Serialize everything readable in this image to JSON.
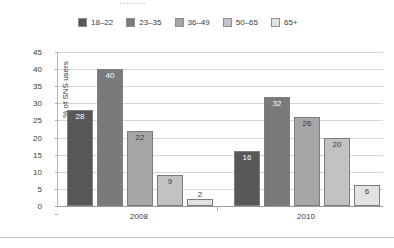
{
  "caption": {
    "text": "•  •   •      •                                                  •   •  •  •"
  },
  "chart_data": {
    "type": "bar",
    "title": "",
    "xlabel": "",
    "ylabel": "% of SNS users",
    "categories": [
      "2008",
      "2010"
    ],
    "ylim": [
      0,
      45
    ],
    "yticks": [
      0,
      5,
      10,
      15,
      20,
      25,
      30,
      35,
      40,
      45
    ],
    "grid": true,
    "legend_position": "top",
    "series": [
      {
        "name": "18–22",
        "color": "#58585a",
        "values": [
          28,
          16
        ]
      },
      {
        "name": "23–35",
        "color": "#7a7a7c",
        "values": [
          40,
          32
        ]
      },
      {
        "name": "36–49",
        "color": "#a6a6a8",
        "values": [
          22,
          26
        ]
      },
      {
        "name": "50–65",
        "color": "#c2c2c4",
        "values": [
          9,
          20
        ]
      },
      {
        "name": "65+",
        "color": "#e2e2e3",
        "values": [
          2,
          6
        ]
      }
    ]
  }
}
